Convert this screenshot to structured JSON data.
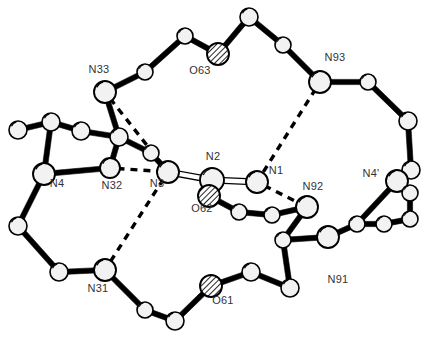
{
  "figure": {
    "type": "molecular-structure-diagram",
    "style": "ORTEP ball-and-stick crystal structure",
    "width": 426,
    "height": 342,
    "background_color": "#ffffff",
    "bond_color": "#000000",
    "atom_outline_color": "#000000",
    "atom_fill_color": "#f2f2f2",
    "hatched_fill_color": "#ffffff",
    "label_color": "#333333",
    "hydrogen_bond_style": "dashed"
  },
  "chart_data": {
    "type": "scatter",
    "title": "",
    "xlabel": "",
    "ylabel": "",
    "grid": false,
    "legend": "none",
    "xlim": [
      0,
      426
    ],
    "ylim": [
      0,
      342
    ],
    "labels": [
      {
        "text": "N33",
        "x": 99,
        "y": 73
      },
      {
        "text": "O63",
        "x": 200,
        "y": 74
      },
      {
        "text": "N93",
        "x": 335,
        "y": 61
      },
      {
        "text": "N2",
        "x": 213,
        "y": 160
      },
      {
        "text": "N1",
        "x": 276,
        "y": 174
      },
      {
        "text": "N4'",
        "x": 371,
        "y": 177
      },
      {
        "text": "N4",
        "x": 57,
        "y": 187
      },
      {
        "text": "N32",
        "x": 112,
        "y": 189
      },
      {
        "text": "N3",
        "x": 157,
        "y": 187
      },
      {
        "text": "N92",
        "x": 313,
        "y": 190
      },
      {
        "text": "O62",
        "x": 202,
        "y": 212
      },
      {
        "text": "N91",
        "x": 338,
        "y": 283
      },
      {
        "text": "N31",
        "x": 98,
        "y": 292
      },
      {
        "text": "O61",
        "x": 223,
        "y": 304
      }
    ],
    "atoms": [
      {
        "id": "a1",
        "label": "N33",
        "x": 105,
        "y": 92,
        "r": 11,
        "kind": "large"
      },
      {
        "id": "a2",
        "label": "",
        "x": 145,
        "y": 72,
        "r": 8,
        "kind": "small"
      },
      {
        "id": "a3",
        "label": "",
        "x": 185,
        "y": 36,
        "r": 8,
        "kind": "small"
      },
      {
        "id": "a4",
        "label": "O63",
        "x": 218,
        "y": 54,
        "r": 11,
        "kind": "hatched"
      },
      {
        "id": "a5",
        "label": "",
        "x": 249,
        "y": 17,
        "r": 9,
        "kind": "small"
      },
      {
        "id": "a6",
        "label": "",
        "x": 283,
        "y": 45,
        "r": 8,
        "kind": "small"
      },
      {
        "id": "a7",
        "label": "N93",
        "x": 320,
        "y": 82,
        "r": 11,
        "kind": "large"
      },
      {
        "id": "a8",
        "label": "",
        "x": 368,
        "y": 82,
        "r": 8,
        "kind": "small"
      },
      {
        "id": "a9",
        "label": "",
        "x": 408,
        "y": 121,
        "r": 9,
        "kind": "small"
      },
      {
        "id": "a10",
        "label": "",
        "x": 411,
        "y": 170,
        "r": 9,
        "kind": "small"
      },
      {
        "id": "a11",
        "label": "N4'",
        "x": 397,
        "y": 181,
        "r": 11,
        "kind": "large"
      },
      {
        "id": "a12",
        "label": "",
        "x": 410,
        "y": 193,
        "r": 8,
        "kind": "small"
      },
      {
        "id": "a13",
        "label": "",
        "x": 410,
        "y": 219,
        "r": 8,
        "kind": "small"
      },
      {
        "id": "a14",
        "label": "",
        "x": 384,
        "y": 224,
        "r": 8,
        "kind": "small"
      },
      {
        "id": "a15",
        "label": "",
        "x": 357,
        "y": 224,
        "r": 8,
        "kind": "small"
      },
      {
        "id": "a16",
        "label": "N91",
        "x": 328,
        "y": 237,
        "r": 11,
        "kind": "large"
      },
      {
        "id": "a17",
        "label": "",
        "x": 283,
        "y": 240,
        "r": 8,
        "kind": "small"
      },
      {
        "id": "a18",
        "label": "N92",
        "x": 307,
        "y": 207,
        "r": 11,
        "kind": "large"
      },
      {
        "id": "a19",
        "label": "",
        "x": 272,
        "y": 215,
        "r": 8,
        "kind": "small"
      },
      {
        "id": "a20",
        "label": "",
        "x": 239,
        "y": 212,
        "r": 8,
        "kind": "small"
      },
      {
        "id": "a21",
        "label": "N1",
        "x": 257,
        "y": 182,
        "r": 11,
        "kind": "large"
      },
      {
        "id": "a22",
        "label": "N2",
        "x": 212,
        "y": 180,
        "r": 12,
        "kind": "large"
      },
      {
        "id": "a23",
        "label": "O62",
        "x": 209,
        "y": 196,
        "r": 11,
        "kind": "hatched"
      },
      {
        "id": "a24",
        "label": "N3",
        "x": 168,
        "y": 172,
        "r": 11,
        "kind": "large"
      },
      {
        "id": "a25",
        "label": "",
        "x": 151,
        "y": 153,
        "r": 8,
        "kind": "small"
      },
      {
        "id": "a26",
        "label": "",
        "x": 119,
        "y": 137,
        "r": 9,
        "kind": "small"
      },
      {
        "id": "a27",
        "label": "",
        "x": 81,
        "y": 131,
        "r": 9,
        "kind": "small"
      },
      {
        "id": "a28",
        "label": "N32",
        "x": 110,
        "y": 168,
        "r": 10,
        "kind": "large"
      },
      {
        "id": "a29",
        "label": "N4",
        "x": 44,
        "y": 174,
        "r": 11,
        "kind": "large"
      },
      {
        "id": "a30",
        "label": "",
        "x": 51,
        "y": 122,
        "r": 9,
        "kind": "small"
      },
      {
        "id": "a31",
        "label": "",
        "x": 18,
        "y": 130,
        "r": 9,
        "kind": "small"
      },
      {
        "id": "a32",
        "label": "",
        "x": 18,
        "y": 226,
        "r": 9,
        "kind": "small"
      },
      {
        "id": "a33",
        "label": "",
        "x": 59,
        "y": 272,
        "r": 9,
        "kind": "small"
      },
      {
        "id": "a34",
        "label": "N31",
        "x": 105,
        "y": 270,
        "r": 11,
        "kind": "large"
      },
      {
        "id": "a35",
        "label": "",
        "x": 145,
        "y": 310,
        "r": 8,
        "kind": "small"
      },
      {
        "id": "a36",
        "label": "",
        "x": 175,
        "y": 321,
        "r": 9,
        "kind": "small"
      },
      {
        "id": "a37",
        "label": "O61",
        "x": 211,
        "y": 286,
        "r": 11,
        "kind": "hatched"
      },
      {
        "id": "a38",
        "label": "",
        "x": 251,
        "y": 272,
        "r": 9,
        "kind": "small"
      },
      {
        "id": "a39",
        "label": "",
        "x": 290,
        "y": 288,
        "r": 9,
        "kind": "small"
      }
    ],
    "bonds": [
      {
        "from": "a1",
        "to": "a2"
      },
      {
        "from": "a2",
        "to": "a3"
      },
      {
        "from": "a3",
        "to": "a4"
      },
      {
        "from": "a4",
        "to": "a5"
      },
      {
        "from": "a5",
        "to": "a6"
      },
      {
        "from": "a6",
        "to": "a7"
      },
      {
        "from": "a7",
        "to": "a8"
      },
      {
        "from": "a8",
        "to": "a9"
      },
      {
        "from": "a9",
        "to": "a10"
      },
      {
        "from": "a10",
        "to": "a11"
      },
      {
        "from": "a11",
        "to": "a12"
      },
      {
        "from": "a12",
        "to": "a13"
      },
      {
        "from": "a13",
        "to": "a14"
      },
      {
        "from": "a11",
        "to": "a15"
      },
      {
        "from": "a14",
        "to": "a15"
      },
      {
        "from": "a15",
        "to": "a16"
      },
      {
        "from": "a16",
        "to": "a17"
      },
      {
        "from": "a17",
        "to": "a18"
      },
      {
        "from": "a18",
        "to": "a19"
      },
      {
        "from": "a19",
        "to": "a20"
      },
      {
        "from": "a20",
        "to": "a23"
      },
      {
        "from": "a17",
        "to": "a39"
      },
      {
        "from": "a39",
        "to": "a38"
      },
      {
        "from": "a38",
        "to": "a37"
      },
      {
        "from": "a37",
        "to": "a36"
      },
      {
        "from": "a36",
        "to": "a35"
      },
      {
        "from": "a35",
        "to": "a34"
      },
      {
        "from": "a34",
        "to": "a33"
      },
      {
        "from": "a33",
        "to": "a32"
      },
      {
        "from": "a32",
        "to": "a29"
      },
      {
        "from": "a29",
        "to": "a30"
      },
      {
        "from": "a30",
        "to": "a31"
      },
      {
        "from": "a30",
        "to": "a27"
      },
      {
        "from": "a27",
        "to": "a26"
      },
      {
        "from": "a26",
        "to": "a1"
      },
      {
        "from": "a29",
        "to": "a28"
      },
      {
        "from": "a28",
        "to": "a26"
      },
      {
        "from": "a24",
        "to": "a25"
      },
      {
        "from": "a25",
        "to": "a26"
      }
    ],
    "double_bonds": [
      {
        "from": "a22",
        "to": "a21"
      },
      {
        "from": "a22",
        "to": "a24"
      }
    ],
    "hydrogen_bonds": [
      {
        "from": "a1",
        "to": "a24"
      },
      {
        "from": "a7",
        "to": "a21"
      },
      {
        "from": "a28",
        "to": "a24"
      },
      {
        "from": "a24",
        "to": "a34"
      },
      {
        "from": "a21",
        "to": "a18"
      }
    ]
  }
}
